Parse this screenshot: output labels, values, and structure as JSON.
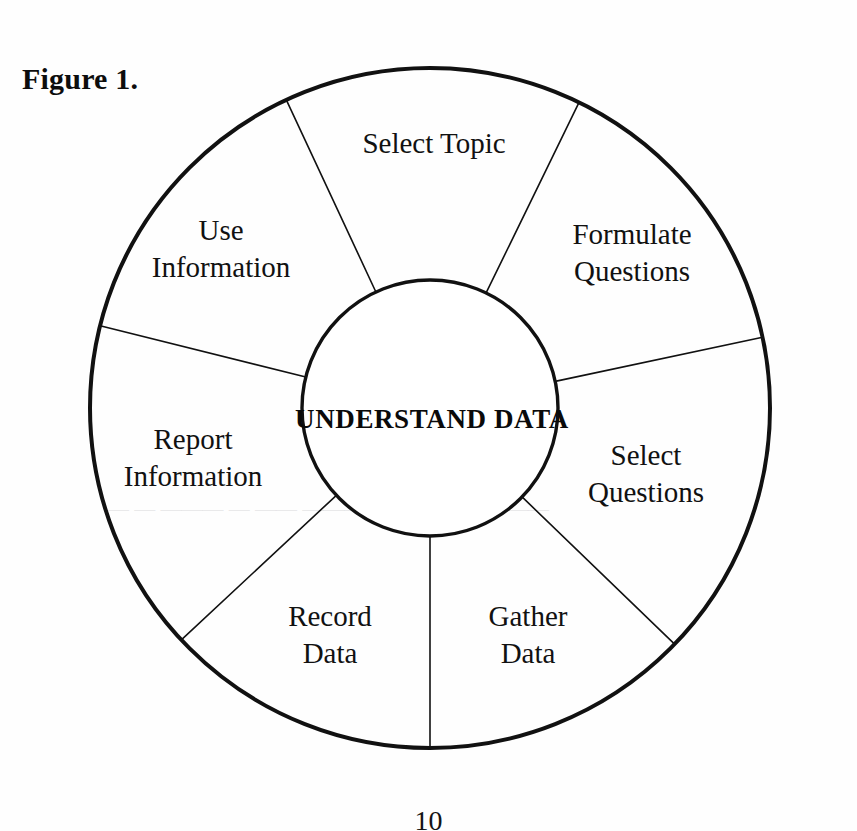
{
  "figure": {
    "caption": "Figure 1."
  },
  "diagram": {
    "type": "cycle-wheel",
    "hub_label": "UNDERSTAND DATA",
    "segment_count": 7,
    "outer_radius": 340,
    "inner_radius": 128,
    "center_x": 430,
    "center_y": 408,
    "stroke_color": "#111111",
    "fill_color": "#ffffff",
    "outer_stroke_width": 4,
    "spoke_stroke_width": 1.6,
    "segments": [
      {
        "id": "select-topic",
        "label_lines": [
          "Select Topic"
        ],
        "start_angle": -115,
        "end_angle": -64,
        "label_x": 434,
        "label_y": 146
      },
      {
        "id": "formulate-questions",
        "label_lines": [
          "Formulate",
          "Questions"
        ],
        "start_angle": -64,
        "end_angle": -12,
        "label_x": 632,
        "label_y": 255
      },
      {
        "id": "select-questions",
        "label_lines": [
          "Select",
          "Questions"
        ],
        "start_angle": -12,
        "end_angle": 44,
        "label_x": 646,
        "label_y": 476
      },
      {
        "id": "gather-data",
        "label_lines": [
          "Gather",
          "Data"
        ],
        "start_angle": 44,
        "end_angle": 90,
        "label_x": 528,
        "label_y": 637
      },
      {
        "id": "record-data",
        "label_lines": [
          "Record",
          "Data"
        ],
        "start_angle": 90,
        "end_angle": 137,
        "label_x": 330,
        "label_y": 637
      },
      {
        "id": "report-information",
        "label_lines": [
          "Report",
          "Information"
        ],
        "start_angle": 137,
        "end_angle": 194,
        "label_x": 193,
        "label_y": 460
      },
      {
        "id": "use-information",
        "label_lines": [
          "Use",
          "Information"
        ],
        "start_angle": 194,
        "end_angle": 245,
        "label_x": 221,
        "label_y": 251
      }
    ]
  },
  "bleed_through": {
    "note": "faint reverse-side text visible through the scanned paper",
    "line": "— —  ———  — ——  ———— —— ——  ———"
  },
  "page_number": "10"
}
